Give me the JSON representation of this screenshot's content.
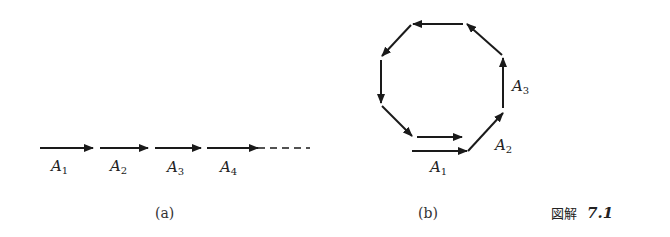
{
  "panel_a": {
    "labels": [
      {
        "main": "A",
        "sub": "1"
      },
      {
        "main": "A",
        "sub": "2"
      },
      {
        "main": "A",
        "sub": "3"
      },
      {
        "main": "A",
        "sub": "4"
      }
    ],
    "caption": "(a)"
  },
  "panel_b": {
    "labels": [
      {
        "main": "A",
        "sub": "1"
      },
      {
        "main": "A",
        "sub": "2"
      },
      {
        "main": "A",
        "sub": "3"
      }
    ],
    "caption": "(b)"
  },
  "figure_label": {
    "prefix": "図解",
    "number": "7.1"
  },
  "colors": {
    "ink": "#1a1a1a"
  }
}
